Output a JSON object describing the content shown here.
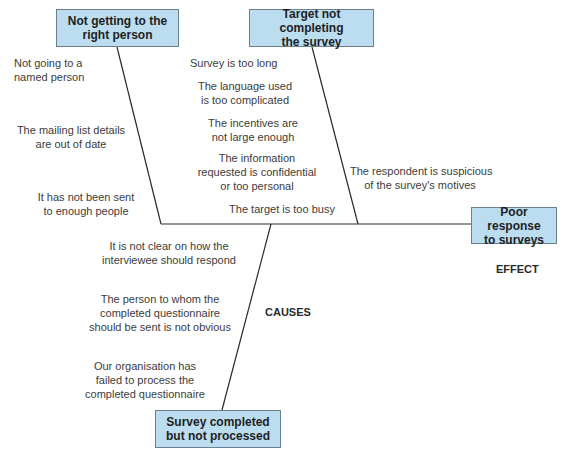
{
  "effect": {
    "label": "Poor response to surveys",
    "line1": "Poor response",
    "line2": "to surveys",
    "tag": "EFFECT"
  },
  "causes_tag": "CAUSES",
  "categories": [
    {
      "id": "not-right-person",
      "line1": "Not getting to the",
      "line2": "right person",
      "causes": [
        {
          "line1": "Not going to a",
          "line2": "named person"
        },
        {
          "line1": "The mailing list details",
          "line2": "are out of date"
        },
        {
          "line1": "It has not been sent",
          "line2": "to enough people"
        }
      ]
    },
    {
      "id": "target-not-completing",
      "line1": "Target not completing",
      "line2": "the survey",
      "causes": [
        {
          "line1": "Survey is too long"
        },
        {
          "line1": "The language used",
          "line2": "is too complicated"
        },
        {
          "line1": "The incentives are",
          "line2": "not large enough"
        },
        {
          "line1": "The information",
          "line2": "requested is confidential",
          "line3": "or too personal"
        },
        {
          "line1": "The target is too busy"
        },
        {
          "line1": "The respondent is suspicious",
          "line2": "of the survey's motives"
        }
      ]
    },
    {
      "id": "completed-not-processed",
      "line1": "Survey completed",
      "line2": "but not processed",
      "causes": [
        {
          "line1": "It is not clear on how the",
          "line2": "interviewee should respond"
        },
        {
          "line1": "The person to whom the",
          "line2": "completed questionnaire",
          "line3": "should be sent is not obvious"
        },
        {
          "line1": "Our organisation has",
          "line2": "failed to process the",
          "line3": "completed questionnaire"
        }
      ]
    }
  ],
  "colors": {
    "box_fill": "#bcdcf0",
    "box_border": "#6c7f8c",
    "line": "#2a2a2a"
  }
}
